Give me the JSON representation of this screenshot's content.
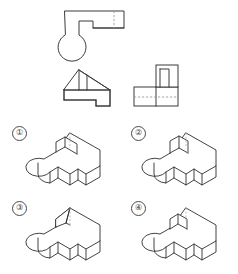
{
  "page": {
    "background_color": "#ffffff",
    "line_color": "#3b3b3b",
    "hidden_line_color": "#9a9a9a",
    "width": 238,
    "height": 274
  },
  "views": {
    "section_label": "Orthographic Views",
    "items": [
      {
        "id": "top-view",
        "name": "Top View",
        "description": "L-shaped outline with rounded lower-left corner, rectangular notch at center, vertical hidden dashed line near right",
        "has_hidden_lines": true,
        "hidden_line_count": 1
      },
      {
        "id": "front-view",
        "name": "Front View",
        "description": "Rectangular base with stepped right notch and triangular sloped top with two vertical division lines",
        "has_hidden_lines": false,
        "hidden_line_count": 0
      },
      {
        "id": "side-view",
        "name": "Side View",
        "description": "Rectangular base with raised rectangular block on upper right containing inner rectangle, horizontal hidden dashed line across base",
        "has_hidden_lines": true,
        "hidden_line_count": 1
      }
    ]
  },
  "options": {
    "section_label": "Answer Choices",
    "count": 4,
    "items": [
      {
        "number": "1",
        "marker": "①",
        "label": "Option 1",
        "description": "Isometric solid: L-shaped plate with rounded left lobe, rectangular upright block at rear-left, tall rear arm, hidden dashed vertical edge behind block"
      },
      {
        "number": "2",
        "marker": "②",
        "label": "Option 2",
        "description": "Isometric solid: L-shaped plate with rounded left lobe, rectangular upright block at rear-left without top cap visible, hidden dashed vertical edge"
      },
      {
        "number": "3",
        "marker": "③",
        "label": "Option 3",
        "description": "Isometric solid: L-shaped plate with rounded left lobe, wedge / triangular pyramid feature at rear-left instead of prismatic block"
      },
      {
        "number": "4",
        "marker": "④",
        "label": "Option 4",
        "description": "Isometric solid: L-shaped plate with rounded left lobe, short rectangular upright block at rear-left, hidden dashed vertical edge"
      }
    ]
  }
}
